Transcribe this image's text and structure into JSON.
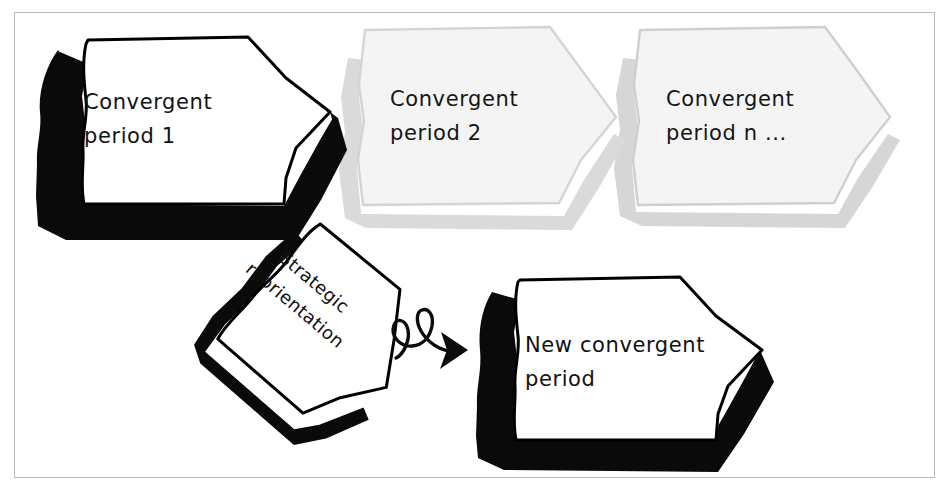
{
  "diagram": {
    "title_visible": false,
    "background_color": "#ffffff",
    "frame_color": "#b9b9b9",
    "ink_color": "#000000",
    "faded_ink_color": "#d7d7d7",
    "faded_fill_color": "#f2f2f2",
    "nodes": [
      {
        "id": "convergent-period-1",
        "line1": "Convergent",
        "line2": "period 1",
        "state": "active",
        "outline_color": "#000000",
        "shadow_color": "#000000",
        "fill_color": "#ffffff",
        "rotation_deg": 0
      },
      {
        "id": "convergent-period-2",
        "line1": "Convergent",
        "line2": "period 2",
        "state": "faded",
        "outline_color": "#d7d7d7",
        "shadow_color": "#d9d9d9",
        "fill_color": "#f4f4f4",
        "rotation_deg": 0
      },
      {
        "id": "convergent-period-n",
        "line1": "Convergent",
        "line2": "period n ...",
        "state": "faded",
        "outline_color": "#d2d2d2",
        "shadow_color": "#d4d4d4",
        "fill_color": "#f4f4f4",
        "rotation_deg": 0
      },
      {
        "id": "strategic-reorientation",
        "line1": "Strategic",
        "line2": "reorientation",
        "state": "active",
        "outline_color": "#000000",
        "shadow_color": "#000000",
        "fill_color": "#ffffff",
        "rotation_deg": 40
      },
      {
        "id": "new-convergent-period",
        "line1": "New convergent",
        "line2": "period",
        "state": "active",
        "outline_color": "#000000",
        "shadow_color": "#000000",
        "fill_color": "#ffffff",
        "rotation_deg": 0
      }
    ],
    "connector": {
      "id": "squiggly-arrow",
      "from": "strategic-reorientation",
      "to": "new-convergent-period",
      "style": "curly-loop-arrow",
      "color": "#000000"
    }
  }
}
